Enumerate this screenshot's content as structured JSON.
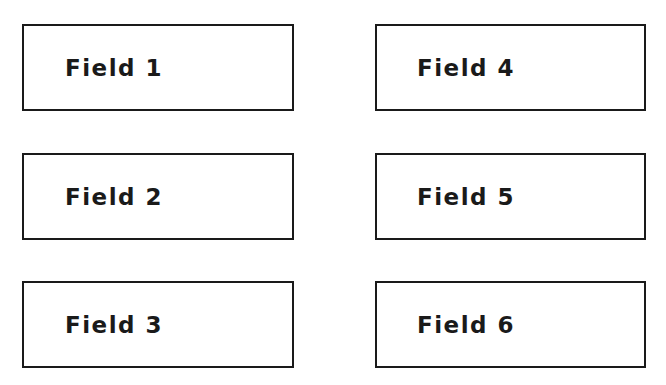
{
  "fields": [
    {
      "label": "Field 1"
    },
    {
      "label": "Field 2"
    },
    {
      "label": "Field 3"
    },
    {
      "label": "Field 4"
    },
    {
      "label": "Field 5"
    },
    {
      "label": "Field 6"
    }
  ],
  "colors": {
    "border": "#1a1a1a",
    "text": "#1a1a1a",
    "background": "#ffffff"
  }
}
